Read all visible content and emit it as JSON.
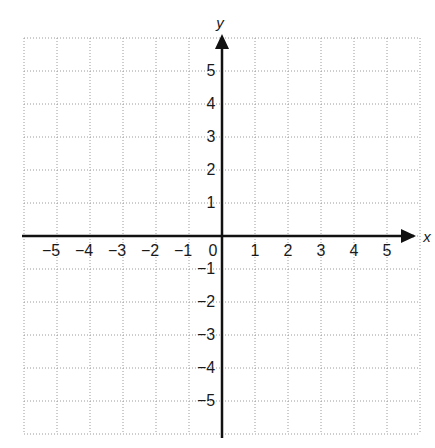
{
  "chart_data": {
    "type": "coordinate-grid",
    "title": "",
    "xlabel": "x",
    "ylabel": "y",
    "xlim": [
      -6,
      6
    ],
    "ylim": [
      -6,
      6
    ],
    "grid": true,
    "grid_style": "dotted",
    "x_ticks": [
      -5,
      -4,
      -3,
      -2,
      -1,
      1,
      2,
      3,
      4,
      5
    ],
    "y_ticks": [
      5,
      4,
      3,
      2,
      1,
      -1,
      -2,
      -3,
      -4,
      -5
    ],
    "origin_label": "0",
    "x_tick_labels": [
      "−5",
      "−4",
      "−3",
      "−2",
      "−1",
      "1",
      "2",
      "3",
      "4",
      "5"
    ],
    "y_tick_labels": [
      "5",
      "4",
      "3",
      "2",
      "1",
      "−1",
      "−2",
      "−3",
      "−4",
      "−5"
    ],
    "arrows": [
      "positive-x",
      "positive-y"
    ],
    "series": []
  },
  "layout": {
    "grid_left": 24,
    "grid_top": 38,
    "cell": 33,
    "cells": 12,
    "grid_color": "#9a9a9a",
    "axis_color": "#111111"
  }
}
